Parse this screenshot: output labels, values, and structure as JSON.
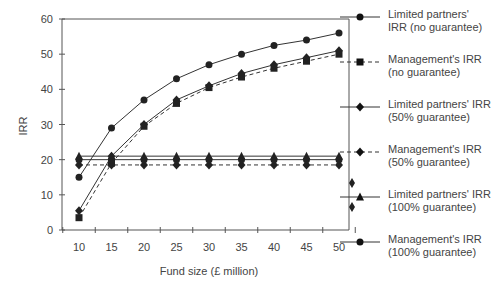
{
  "chart_data": {
    "type": "line",
    "title": "",
    "xlabel": "Fund size (£ million)",
    "ylabel": "IRR",
    "x": [
      10,
      15,
      20,
      25,
      30,
      35,
      40,
      45,
      50
    ],
    "xticks": [
      "10",
      "15",
      "20",
      "25",
      "30",
      "35",
      "40",
      "45",
      "50"
    ],
    "yticks": [
      "0",
      "10",
      "20",
      "30",
      "40",
      "50",
      "60"
    ],
    "ylim": [
      0,
      60
    ],
    "xlim": [
      7.5,
      52.5
    ],
    "grid": false,
    "legend_position": "right",
    "series": [
      {
        "name": "Limited partners' IRR (no guarantee)",
        "marker": "circle",
        "dash": "solid",
        "values": [
          15,
          29,
          37,
          43,
          47,
          50,
          52.5,
          54,
          56
        ]
      },
      {
        "name": "Management's IRR (no guarantee)",
        "marker": "square",
        "dash": "dashed",
        "values": [
          3.5,
          19,
          29.5,
          36,
          40.5,
          43.5,
          46,
          48,
          50
        ]
      },
      {
        "name": "Limited partners' IRR (50% guarantee)",
        "marker": "diamond",
        "dash": "solid",
        "values": [
          5.5,
          21,
          30,
          37,
          41,
          44.5,
          47,
          49,
          51
        ]
      },
      {
        "name": "Management's IRR (50% guarantee)",
        "marker": "diamond",
        "dash": "dashed",
        "values": [
          18.5,
          18.5,
          18.5,
          18.5,
          18.5,
          18.5,
          18.5,
          18.5,
          18.5
        ]
      },
      {
        "name": "Limited partners' IRR (100% guarantee)",
        "marker": "triangle",
        "dash": "solid",
        "values": [
          21,
          21,
          21,
          21,
          21,
          21,
          21,
          21,
          21
        ]
      },
      {
        "name": "Management's IRR (100% guarantee)",
        "marker": "circle",
        "dash": "solid",
        "values": [
          20,
          20,
          20,
          20,
          20,
          20,
          20,
          20,
          20
        ]
      }
    ]
  },
  "legend": {
    "items": [
      {
        "line1": "Limited partners'",
        "line2": "IRR (no guarantee)"
      },
      {
        "line1": "Management's IRR",
        "line2": "(no guarantee)"
      },
      {
        "line1": "Limited partners' IRR",
        "line2": "(50% guarantee)"
      },
      {
        "line1": "Management's IRR",
        "line2": "(50% guarantee)"
      },
      {
        "line1": "Limited partners' IRR",
        "line2": "(100% guarantee)"
      },
      {
        "line1": "Management's IRR",
        "line2": "(100% guarantee)"
      }
    ]
  },
  "colors": {
    "line": "#333333",
    "axis": "#555555",
    "text": "#444444"
  }
}
